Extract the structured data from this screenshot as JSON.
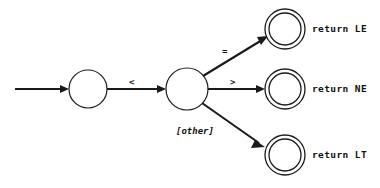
{
  "diagram": {
    "type": "state-machine",
    "title": "",
    "background_color": "#ffffff",
    "stroke_color": "#1a1a1a",
    "states": [
      {
        "id": "s0",
        "kind": "state",
        "label": "",
        "cx": 88,
        "cy": 89,
        "r": 19
      },
      {
        "id": "s1",
        "kind": "state",
        "label": "",
        "cx": 187,
        "cy": 89,
        "r": 21
      },
      {
        "id": "s2",
        "kind": "accepting",
        "label": "",
        "cx": 285,
        "cy": 29,
        "r_outer": 20,
        "r_inner": 16
      },
      {
        "id": "s3",
        "kind": "accepting",
        "label": "",
        "cx": 285,
        "cy": 89,
        "r_outer": 20,
        "r_inner": 16
      },
      {
        "id": "s4",
        "kind": "accepting",
        "label": "",
        "cx": 285,
        "cy": 155,
        "r_outer": 20,
        "r_inner": 16
      }
    ],
    "start_arrow": {
      "from_x": 15,
      "to_x": 67,
      "y": 89
    },
    "transitions": [
      {
        "id": "t0",
        "from": "s0",
        "to": "s1",
        "label": "<"
      },
      {
        "id": "t1",
        "from": "s1",
        "to": "s2",
        "label": "="
      },
      {
        "id": "t2",
        "from": "s1",
        "to": "s3",
        "label": ">"
      },
      {
        "id": "t3",
        "from": "s1",
        "to": "s4",
        "label": "[other]"
      }
    ],
    "edge_labels": {
      "lt": "<",
      "eq": "=",
      "gt": ">",
      "other": "[other]"
    },
    "accept_labels": {
      "le": "return LE",
      "ne": "return NE",
      "lt": "return LT"
    }
  }
}
